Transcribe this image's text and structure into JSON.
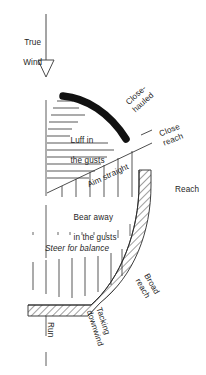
{
  "figure": {
    "type": "points-of-sail-diagram",
    "background_color": "#ffffff",
    "ink_color": "#1f1f1f",
    "no_go_zone_color": "#111111"
  },
  "wind": {
    "label_line1": "True",
    "label_line2": "Wind",
    "arrow_direction": "down",
    "arrowhead_style": "open-triangle"
  },
  "points_of_sail": {
    "close_hauled_line1": "Close-",
    "close_hauled_line2": "hauled",
    "close_reach_line1": "Close",
    "close_reach_line2": "reach",
    "reach": "Reach",
    "broad_reach_line1": "Broad",
    "broad_reach_line2": "reach",
    "tacking_downwind_line1": "Tacking",
    "tacking_downwind_line2": "downwind",
    "run": "Run"
  },
  "steering_advice": {
    "luff_line1": "Luff in",
    "luff_line2": "the gusts",
    "aim_straight": "Aim straight",
    "bear_away_line1": "Bear away",
    "bear_away_line2": "in the gusts",
    "steer_for_balance": "Steer for balance"
  }
}
